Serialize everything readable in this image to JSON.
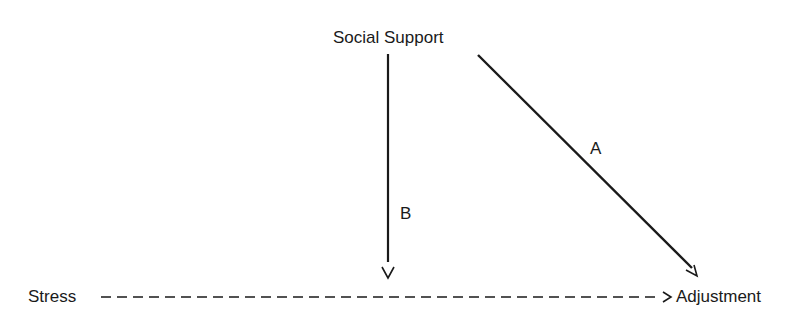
{
  "diagram": {
    "nodes": {
      "social_support": "Social Support",
      "stress": "Stress",
      "adjustment": "Adjustment"
    },
    "paths": {
      "a_label": "A",
      "b_label": "B"
    },
    "edges": [
      {
        "from": "Social Support",
        "to": "Adjustment",
        "label": "A",
        "style": "solid"
      },
      {
        "from": "Social Support",
        "to": "Stress-Adjustment path",
        "label": "B",
        "style": "solid"
      },
      {
        "from": "Stress",
        "to": "Adjustment",
        "label": "",
        "style": "dashed"
      }
    ],
    "colors": {
      "ink": "#1a1a1a",
      "background": "#ffffff"
    }
  }
}
